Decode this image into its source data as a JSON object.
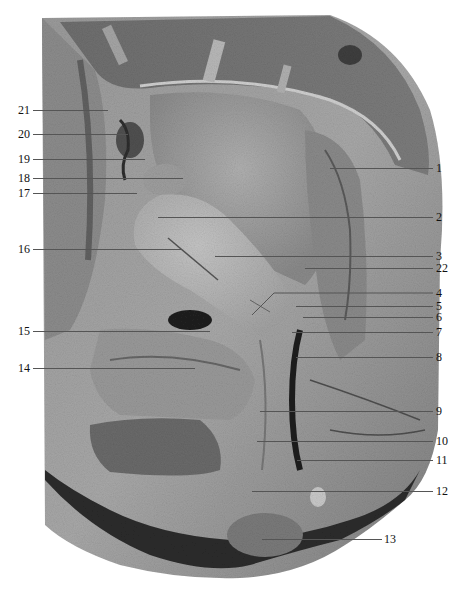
{
  "figure": {
    "colors": {
      "background": "#ffffff",
      "tissue_light": "#b8b8b8",
      "tissue_mid": "#8f8f8f",
      "tissue_dark": "#4a4a4a",
      "label_text": "#111111",
      "leader_line": "#555555"
    }
  },
  "labels_left": [
    {
      "num": "21",
      "y": 110,
      "x_end": 108
    },
    {
      "num": "20",
      "y": 134,
      "x_end": 128
    },
    {
      "num": "19",
      "y": 159,
      "x_end": 145
    },
    {
      "num": "18",
      "y": 178,
      "x_end": 183
    },
    {
      "num": "17",
      "y": 193,
      "x_end": 137
    },
    {
      "num": "16",
      "y": 249,
      "x_end": 182
    },
    {
      "num": "15",
      "y": 331,
      "x_end": 210
    },
    {
      "num": "14",
      "y": 368,
      "x_end": 195
    }
  ],
  "labels_right": [
    {
      "num": "1",
      "y": 168,
      "x_start": 330
    },
    {
      "num": "2",
      "y": 217,
      "x_start": 158
    },
    {
      "num": "3",
      "y": 256,
      "x_start": 215
    },
    {
      "num": "22",
      "y": 268,
      "x_start": 305
    },
    {
      "num": "4",
      "y": 293,
      "x_start": 272
    },
    {
      "num": "5",
      "y": 306,
      "x_start": 296
    },
    {
      "num": "6",
      "y": 317,
      "x_start": 303
    },
    {
      "num": "7",
      "y": 332,
      "x_start": 292
    },
    {
      "num": "8",
      "y": 357,
      "x_start": 296
    },
    {
      "num": "9",
      "y": 411,
      "x_start": 260
    },
    {
      "num": "10",
      "y": 441,
      "x_start": 257
    },
    {
      "num": "11",
      "y": 460,
      "x_start": 297
    },
    {
      "num": "12",
      "y": 491,
      "x_start": 252
    },
    {
      "num": "13",
      "y": 539,
      "x_start": 262
    }
  ]
}
